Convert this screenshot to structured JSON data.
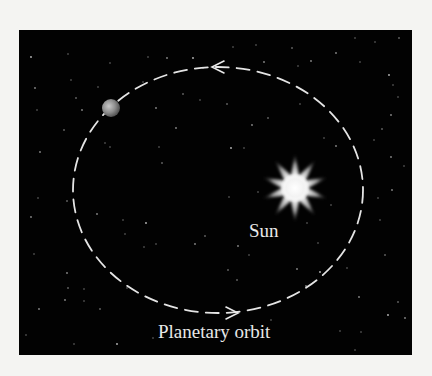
{
  "diagram": {
    "type": "solar-orbit-illustration",
    "background_color": "#020202",
    "page_color": "#f4f4f2",
    "panel": {
      "x": 19,
      "y": 30,
      "width": 393,
      "height": 325
    },
    "orbit": {
      "shape": "ellipse-dashed",
      "cx": 218,
      "cy": 190,
      "rx": 145,
      "ry": 123,
      "color": "#e4e4e4",
      "direction": "counterclockwise",
      "arrows": [
        {
          "position": "top",
          "x": 215,
          "y": 67,
          "points": "left"
        },
        {
          "position": "bottom",
          "x": 232,
          "y": 313,
          "points": "right"
        }
      ]
    },
    "sun": {
      "cx": 295,
      "cy": 188,
      "points": 10,
      "outer_r": 34,
      "inner_r": 13,
      "color": "#ffffff"
    },
    "planet": {
      "cx": 111,
      "cy": 108,
      "r": 9,
      "color": "#9a9a9a"
    },
    "labels": {
      "sun": "Sun",
      "orbit": "Planetary orbit"
    },
    "stars": [
      [
        31,
        57
      ],
      [
        68,
        54
      ],
      [
        71,
        80
      ],
      [
        35,
        88
      ],
      [
        76,
        98
      ],
      [
        37,
        110
      ],
      [
        82,
        110
      ],
      [
        105,
        143
      ],
      [
        64,
        130
      ],
      [
        40,
        152
      ],
      [
        110,
        147
      ],
      [
        110,
        63
      ],
      [
        106,
        112
      ],
      [
        98,
        87
      ],
      [
        148,
        57
      ],
      [
        167,
        58
      ],
      [
        183,
        94
      ],
      [
        143,
        82
      ],
      [
        176,
        128
      ],
      [
        159,
        147
      ],
      [
        162,
        163
      ],
      [
        156,
        108
      ],
      [
        200,
        100
      ],
      [
        203,
        68
      ],
      [
        193,
        58
      ],
      [
        233,
        47
      ],
      [
        256,
        45
      ],
      [
        264,
        62
      ],
      [
        292,
        48
      ],
      [
        298,
        66
      ],
      [
        311,
        61
      ],
      [
        355,
        38
      ],
      [
        399,
        38
      ],
      [
        336,
        53
      ],
      [
        360,
        62
      ],
      [
        375,
        42
      ],
      [
        389,
        75
      ],
      [
        393,
        85
      ],
      [
        398,
        97
      ],
      [
        391,
        115
      ],
      [
        382,
        129
      ],
      [
        374,
        140
      ],
      [
        391,
        157
      ],
      [
        404,
        166
      ],
      [
        227,
        104
      ],
      [
        252,
        125
      ],
      [
        244,
        148
      ],
      [
        300,
        104
      ],
      [
        231,
        148
      ],
      [
        258,
        192
      ],
      [
        324,
        138
      ],
      [
        336,
        146
      ],
      [
        268,
        118
      ],
      [
        38,
        198
      ],
      [
        31,
        217
      ],
      [
        34,
        254
      ],
      [
        67,
        201
      ],
      [
        97,
        214
      ],
      [
        123,
        220
      ],
      [
        125,
        234
      ],
      [
        146,
        223
      ],
      [
        144,
        247
      ],
      [
        127,
        288
      ],
      [
        67,
        273
      ],
      [
        68,
        288
      ],
      [
        84,
        289
      ],
      [
        65,
        300
      ],
      [
        84,
        301
      ],
      [
        100,
        309
      ],
      [
        39,
        309
      ],
      [
        26,
        335
      ],
      [
        74,
        344
      ],
      [
        117,
        344
      ],
      [
        153,
        338
      ],
      [
        156,
        244
      ],
      [
        195,
        244
      ],
      [
        205,
        236
      ],
      [
        229,
        197
      ],
      [
        238,
        246
      ],
      [
        249,
        255
      ],
      [
        237,
        280
      ],
      [
        297,
        269
      ],
      [
        307,
        223
      ],
      [
        318,
        243
      ],
      [
        320,
        272
      ],
      [
        331,
        205
      ],
      [
        347,
        268
      ],
      [
        359,
        297
      ],
      [
        385,
        255
      ],
      [
        380,
        220
      ],
      [
        392,
        190
      ],
      [
        378,
        198
      ],
      [
        398,
        302
      ],
      [
        405,
        318
      ],
      [
        340,
        331
      ],
      [
        361,
        332
      ],
      [
        388,
        315
      ],
      [
        355,
        350
      ],
      [
        271,
        320
      ],
      [
        306,
        286
      ],
      [
        228,
        270
      ]
    ]
  }
}
